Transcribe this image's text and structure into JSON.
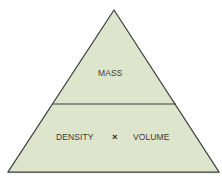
{
  "diagram": {
    "type": "formula-triangle",
    "colors": {
      "fill": "#dde6cc",
      "stroke": "#3c3c3c",
      "text": "#3a3a3a",
      "background": "#ffffff"
    },
    "top_section": {
      "label": "MASS"
    },
    "bottom_section": {
      "left_label": "DENSITY",
      "operator": "×",
      "right_label": "VOLUME"
    }
  }
}
